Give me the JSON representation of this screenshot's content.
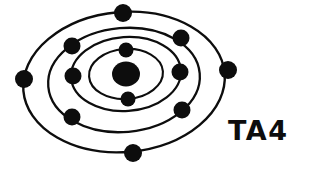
{
  "diagram": {
    "type": "atomic-shell-diagram",
    "style": "hand-drawn ink on white",
    "background_color": "#ffffff",
    "ink_color": "#0d0d0d",
    "canvas": {
      "width": 312,
      "height": 170
    },
    "label": {
      "text": "TA4",
      "x": 228,
      "y": 140,
      "color": "#0d0d0d"
    },
    "nucleus": {
      "name": "nucleus",
      "cx": 126,
      "cy": 74,
      "rx": 14,
      "ry": 12.5,
      "color": "#0d0d0d"
    },
    "shells": [
      {
        "index": 1,
        "name": "shell-1-innermost",
        "cx": 126,
        "cy": 74,
        "rx": 37,
        "ry": 25,
        "rotation": -4,
        "stroke_width": 2.1,
        "electron_count": 2,
        "electrons": [
          {
            "cx": 126,
            "cy": 50,
            "r": 7.5
          },
          {
            "cx": 128,
            "cy": 99,
            "r": 7.5
          }
        ]
      },
      {
        "index": 2,
        "name": "shell-2",
        "cx": 126,
        "cy": 74,
        "rx": 55,
        "ry": 37,
        "rotation": -4,
        "stroke_width": 2.2,
        "electron_count": 2,
        "electrons": [
          {
            "cx": 73,
            "cy": 76,
            "r": 8.5
          },
          {
            "cx": 180,
            "cy": 72,
            "r": 8.5
          }
        ]
      },
      {
        "index": 3,
        "name": "shell-3",
        "cx": 124,
        "cy": 80,
        "rx": 76,
        "ry": 52,
        "rotation": -5,
        "stroke_width": 2.3,
        "electron_count": 3,
        "electrons": [
          {
            "cx": 72,
            "cy": 46,
            "r": 8.5
          },
          {
            "cx": 181,
            "cy": 38,
            "r": 8.5
          },
          {
            "cx": 72,
            "cy": 117,
            "r": 8.5
          },
          {
            "cx": 182,
            "cy": 110,
            "r": 8.5
          }
        ]
      },
      {
        "index": 4,
        "name": "shell-4-outermost",
        "cx": 124,
        "cy": 82,
        "rx": 101,
        "ry": 70,
        "rotation": -5,
        "stroke_width": 2.4,
        "electron_count": 4,
        "electrons": [
          {
            "cx": 123,
            "cy": 13,
            "r": 9
          },
          {
            "cx": 24,
            "cy": 79,
            "r": 9
          },
          {
            "cx": 228,
            "cy": 70,
            "r": 9
          },
          {
            "cx": 133,
            "cy": 153,
            "r": 9
          }
        ]
      }
    ],
    "totals": {
      "electron_count": 13,
      "shell_count": 4
    }
  }
}
